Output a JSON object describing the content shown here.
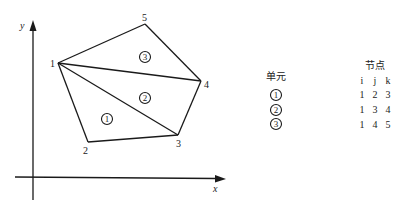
{
  "diagram": {
    "axes": {
      "x_label": "x",
      "y_label": "y",
      "color": "#1a1a1a"
    },
    "nodes": [
      {
        "id": "1",
        "x": 58,
        "y": 63,
        "label": "1",
        "lx": 50,
        "ly": 67
      },
      {
        "id": "2",
        "x": 88,
        "y": 142,
        "label": "2",
        "lx": 83,
        "ly": 154
      },
      {
        "id": "3",
        "x": 178,
        "y": 135,
        "label": "3",
        "lx": 178,
        "ly": 147
      },
      {
        "id": "4",
        "x": 201,
        "y": 81,
        "label": "4",
        "lx": 204,
        "ly": 88
      },
      {
        "id": "5",
        "x": 145,
        "y": 24,
        "label": "5",
        "lx": 143,
        "ly": 21
      }
    ],
    "elements": [
      {
        "id": "1",
        "label": "1",
        "cx": 107,
        "cy": 119,
        "nodes": [
          "1",
          "2",
          "3"
        ]
      },
      {
        "id": "2",
        "label": "2",
        "cx": 145,
        "cy": 98,
        "nodes": [
          "1",
          "3",
          "4"
        ]
      },
      {
        "id": "3",
        "label": "3",
        "cx": 145,
        "cy": 57,
        "nodes": [
          "1",
          "4",
          "5"
        ]
      }
    ],
    "line_color": "#1a1a1a"
  },
  "table": {
    "element_header": "单元",
    "node_header": "节点",
    "columns": [
      "i",
      "j",
      "k"
    ],
    "rows": [
      {
        "element": "1",
        "i": "1",
        "j": "2",
        "k": "3"
      },
      {
        "element": "2",
        "i": "1",
        "j": "3",
        "k": "4"
      },
      {
        "element": "3",
        "i": "1",
        "j": "4",
        "k": "5"
      }
    ]
  }
}
